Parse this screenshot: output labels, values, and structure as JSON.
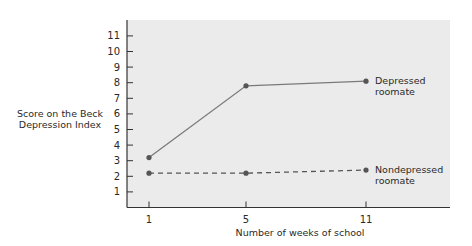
{
  "chart_data": {
    "type": "line",
    "title": "",
    "xlabel": "Number of weeks of school",
    "ylabel": "Score on the Beck Depression Index",
    "x": [
      1,
      5,
      11
    ],
    "x_tick_labels": [
      "1",
      "5",
      "11"
    ],
    "y_ticks": [
      1,
      2,
      3,
      4,
      5,
      6,
      7,
      8,
      9,
      10,
      11
    ],
    "ylim": [
      0,
      11.5
    ],
    "grid": false,
    "legend_position": "inline-right",
    "series": [
      {
        "name": "Depressed roomate",
        "values": [
          3.2,
          7.8,
          8.1
        ],
        "line_style": "solid",
        "color": "#7a7a7a"
      },
      {
        "name": "Nondepressed roomate",
        "values": [
          2.2,
          2.2,
          2.4
        ],
        "line_style": "dashed",
        "color": "#555555"
      }
    ]
  },
  "labels": {
    "ylabel_line1": "Score on the Beck",
    "ylabel_line2": "Depression Index",
    "xlabel": "Number of weeks of school",
    "legend_depressed_line1": "Depressed",
    "legend_depressed_line2": "roomate",
    "legend_nondepressed_line1": "Nondepressed",
    "legend_nondepressed_line2": "roomate"
  }
}
